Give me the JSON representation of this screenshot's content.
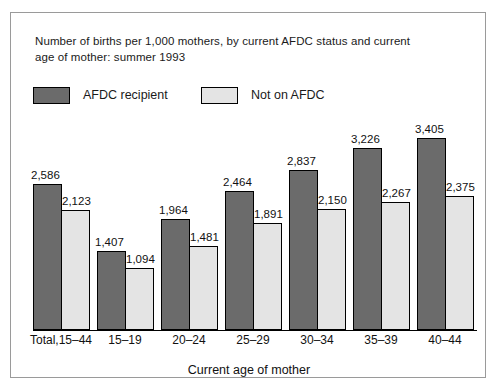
{
  "figure": {
    "title_lines": [
      "Number of births per 1,000 mothers, by current AFDC status and current",
      "age of mother: summer 1993"
    ],
    "legend": [
      {
        "label": "AFDC recipient",
        "swatch": "dark-gray-swatch",
        "color": "#6b6b6b"
      },
      {
        "label": "Not on AFDC",
        "swatch": "light-gray-swatch",
        "color": "#e4e4e4"
      }
    ],
    "xaxis_title": "Current age of mother"
  },
  "chart_data": {
    "type": "bar",
    "title": "Number of births per 1,000 mothers, by current AFDC status and current age of mother: summer 1993",
    "xlabel": "Current age of mother",
    "ylabel": "",
    "ylim": [
      0,
      3700
    ],
    "grid": false,
    "legend_position": "top-left",
    "categories": [
      "Total,15–44",
      "15–19",
      "20–24",
      "25–29",
      "30–34",
      "35–39",
      "40–44"
    ],
    "series": [
      {
        "name": "AFDC recipient",
        "color": "#6b6b6b",
        "values": [
          2586,
          1407,
          1964,
          2464,
          2837,
          3226,
          3405
        ],
        "labels": [
          "2,586",
          "1,407",
          "1,964",
          "2,464",
          "2,837",
          "3,226",
          "3,405"
        ]
      },
      {
        "name": "Not on AFDC",
        "color": "#e4e4e4",
        "values": [
          2123,
          1094,
          1481,
          1891,
          2150,
          2267,
          2375
        ],
        "labels": [
          "2,123",
          "1,094",
          "1,481",
          "1,891",
          "2,150",
          "2,267",
          "2,375"
        ]
      }
    ]
  }
}
